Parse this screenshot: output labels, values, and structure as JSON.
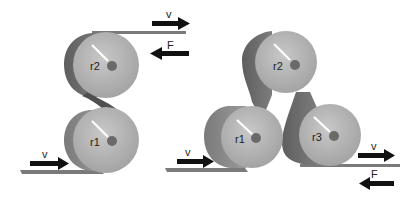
{
  "diagram": {
    "left": {
      "rollers": [
        {
          "label": "r2"
        },
        {
          "label": "r1"
        }
      ],
      "arrows": [
        {
          "label": "v",
          "direction": "right",
          "position": "top"
        },
        {
          "label": "F",
          "direction": "left",
          "position": "top"
        },
        {
          "label": "v",
          "direction": "right",
          "position": "bottom"
        }
      ]
    },
    "right": {
      "rollers": [
        {
          "label": "r2"
        },
        {
          "label": "r1"
        },
        {
          "label": "r3"
        }
      ],
      "arrows": [
        {
          "label": "v",
          "direction": "right",
          "position": "bottom-left"
        },
        {
          "label": "v",
          "direction": "right",
          "position": "bottom-right"
        },
        {
          "label": "F",
          "direction": "left",
          "position": "bottom-right"
        }
      ]
    },
    "colors": {
      "roller_face": "#b8b8b8",
      "roller_side": "#8a8a8a",
      "belt": "#6f6f6f",
      "arrow": "#111111"
    }
  }
}
